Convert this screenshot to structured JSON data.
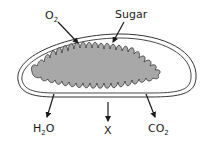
{
  "diagram": {
    "colors": {
      "membrane": "#333333",
      "matrix_fill": "#a8a8a8",
      "background": "#ffffff",
      "arrow": "#1a1a1a"
    },
    "labels": {
      "o2": {
        "main": "O",
        "sub": "2"
      },
      "sugar": {
        "main": "Sugar"
      },
      "h2o": {
        "pre": "H",
        "sub": "2",
        "post": "O"
      },
      "x": {
        "main": "X"
      },
      "co2": {
        "main": "CO",
        "sub": "2"
      }
    }
  }
}
